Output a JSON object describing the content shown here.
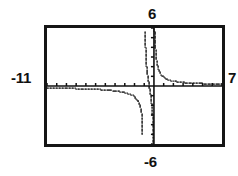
{
  "app": {
    "kind": "graphing-calculator-screen",
    "title": "Graphing calculator viewport"
  },
  "window_labels": {
    "xmin": "-11",
    "xmax": "7",
    "ymax": "6",
    "ymin": "-6"
  },
  "colors": {
    "frame": "#151515",
    "axis": "#111111",
    "curve": "#111111",
    "background": "#ffffff"
  },
  "chart_data": {
    "type": "line",
    "title": "",
    "xlabel": "",
    "ylabel": "",
    "xlim": [
      -11,
      7
    ],
    "ylim": [
      -6,
      6
    ],
    "grid": false,
    "legend": null,
    "axes": {
      "x_axis_at_y": 0,
      "y_axis_at_x": 0,
      "tick_spacing_x": 1,
      "tick_spacing_y": 1,
      "tick_style": "hash-marks-on-axes"
    },
    "asymptotes": {
      "vertical": [
        -1.0,
        0.0
      ],
      "horizontal": [
        0.0
      ]
    },
    "series": [
      {
        "name": "branch-left",
        "comment": "x from Xmin up to vertical asymptote x=-1; stays just below y=0 then plunges",
        "x": [
          -11.0,
          -10.4,
          -9.8,
          -9.2,
          -8.6,
          -8.0,
          -7.4,
          -6.8,
          -6.2,
          -5.6,
          -5.0,
          -4.5,
          -4.0,
          -3.6,
          -3.2,
          -2.8,
          -2.5,
          -2.2,
          -2.0,
          -1.8,
          -1.6,
          -1.45,
          -1.35,
          -1.28,
          -1.22,
          -1.18
        ],
        "y": [
          -0.2,
          -0.21,
          -0.22,
          -0.23,
          -0.25,
          -0.26,
          -0.28,
          -0.3,
          -0.33,
          -0.36,
          -0.4,
          -0.44,
          -0.5,
          -0.56,
          -0.63,
          -0.73,
          -0.83,
          -0.97,
          -1.1,
          -1.3,
          -1.6,
          -1.95,
          -2.35,
          -2.85,
          -3.6,
          -5.1
        ]
      },
      {
        "name": "branch-middle",
        "comment": "between vertical asymptotes x=-1 and x=0; comes down from +6, crosses x-axis, plunges to -6",
        "x": [
          -0.92,
          -0.88,
          -0.84,
          -0.8,
          -0.76,
          -0.72,
          -0.68,
          -0.62,
          -0.56,
          -0.5,
          -0.44,
          -0.38,
          -0.33,
          -0.28,
          -0.24,
          -0.2,
          -0.17,
          -0.14,
          -0.115,
          -0.095,
          -0.08,
          -0.065,
          -0.055
        ],
        "y": [
          5.6,
          4.2,
          3.2,
          2.5,
          1.95,
          1.55,
          1.2,
          0.78,
          0.42,
          0.05,
          -0.3,
          -0.7,
          -1.05,
          -1.45,
          -1.85,
          -2.3,
          -2.75,
          -3.3,
          -3.85,
          -4.4,
          -4.95,
          -5.55,
          -5.95
        ]
      },
      {
        "name": "branch-right",
        "comment": "x > 0; descends from +6 near the y-axis and decays toward y=0 as x grows",
        "x": [
          0.05,
          0.08,
          0.11,
          0.15,
          0.2,
          0.26,
          0.33,
          0.42,
          0.53,
          0.66,
          0.82,
          1.0,
          1.22,
          1.48,
          1.78,
          2.12,
          2.5,
          2.95,
          3.45,
          4.0,
          4.6,
          5.25,
          5.95,
          6.6,
          7.0
        ],
        "y": [
          5.85,
          5.2,
          4.55,
          3.9,
          3.3,
          2.78,
          2.32,
          1.92,
          1.58,
          1.3,
          1.07,
          0.9,
          0.76,
          0.65,
          0.56,
          0.49,
          0.43,
          0.38,
          0.34,
          0.31,
          0.28,
          0.25,
          0.23,
          0.21,
          0.2
        ]
      }
    ]
  }
}
